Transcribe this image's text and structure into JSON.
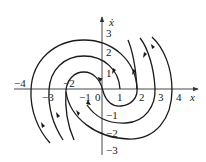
{
  "figure": {
    "type": "phase-portrait",
    "x_axis": {
      "label": "x",
      "ticks": [
        "-4",
        "-3",
        "-2",
        "-1",
        "0",
        "1",
        "2",
        "3",
        "4"
      ]
    },
    "y_axis": {
      "label": "ẋ",
      "ticks": [
        "3",
        "2",
        "1",
        "-1",
        "-2",
        "-3"
      ]
    },
    "origin_label": "0",
    "trajectory_count": 6,
    "colors": {
      "stroke": "#1a1a1a",
      "background": "#ffffff"
    }
  }
}
